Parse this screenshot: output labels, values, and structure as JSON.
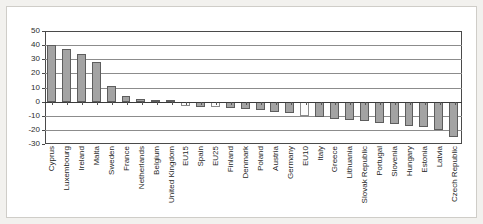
{
  "chart_data": {
    "type": "bar",
    "title": "",
    "subtitle": "",
    "xlabel": "",
    "ylabel": "",
    "ylim": [
      -30,
      50
    ],
    "ytick_labels": [
      "50",
      "40",
      "30",
      "20",
      "10",
      "0",
      "-10",
      "-20",
      "-30"
    ],
    "ytick_values": [
      50,
      40,
      30,
      20,
      10,
      0,
      -10,
      -20,
      -30
    ],
    "grid": true,
    "legend": false,
    "legend_position": "none",
    "bar_fill_color": "#a3a3a3",
    "bar_border_color": "#5d5d5d",
    "aggregate_bar_fill_color": "#fbfbfb",
    "categories": [
      "Cyprus",
      "Luxembourg",
      "Ireland",
      "Malta",
      "Sweden",
      "France",
      "Netherlands",
      "Belgium",
      "United Kingdom",
      "EU15",
      "Spain",
      "EU25",
      "Finland",
      "Denmark",
      "Poland",
      "Austria",
      "Germany",
      "EU10",
      "Italy",
      "Greece",
      "Lithuania",
      "Slovak Republic",
      "Portugal",
      "Slovenia",
      "Hungary",
      "Estonia",
      "Latvia",
      "Czech Republic"
    ],
    "values": [
      40,
      37,
      33.5,
      28,
      11,
      4,
      2,
      1.5,
      1.5,
      -3,
      -3.5,
      -4,
      -4.5,
      -5,
      -6,
      -7,
      -8,
      -10,
      -11,
      -12,
      -13,
      -14,
      -15,
      -16,
      -17,
      -18,
      -20,
      -25
    ],
    "aggregate_series": [
      "EU15",
      "EU25",
      "EU10"
    ]
  }
}
